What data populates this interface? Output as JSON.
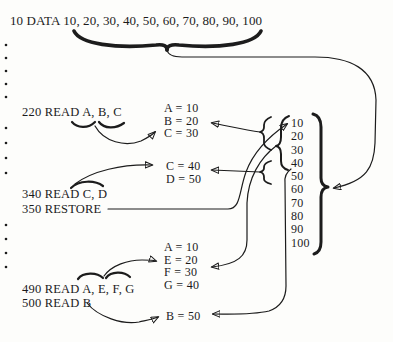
{
  "figure": "basic-data-read-restore-diagram",
  "program": {
    "data_stmt": "10 DATA 10, 20, 30, 40, 50, 60, 70, 80, 90, 100",
    "read_220": "220 READ A, B, C",
    "read_340": "340 READ C, D",
    "restore_350": "350 RESTORE",
    "read_490": "490 READ A, E, F, G",
    "read_500": "500 READ B"
  },
  "assignments": {
    "block1": [
      "A = 10",
      "B = 20",
      "C = 30"
    ],
    "block2": [
      "C = 40",
      "D = 50"
    ],
    "block3": [
      "A = 10",
      "E = 20",
      "F = 30",
      "G = 40"
    ],
    "block4": [
      "B = 50"
    ]
  },
  "data_list": [
    "10",
    "20",
    "30",
    "40",
    "50",
    "60",
    "70",
    "80",
    "90",
    "100"
  ],
  "colors": {
    "ink": "#1c1c1c",
    "paper": "#fdfdfb"
  }
}
